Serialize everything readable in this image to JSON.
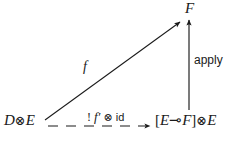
{
  "diagram": {
    "kind": "commutative-diagram",
    "background_color": "#ffffff",
    "ink_color": "#1a1a1a",
    "nodes": {
      "source": {
        "name": "source-object",
        "text": "D ⊗ E",
        "left_factor": "D",
        "tensor": "⊗",
        "right_factor": "E"
      },
      "target": {
        "name": "target-object",
        "text": "[E ⊸ F] ⊗ E",
        "open_bracket": "[",
        "hom_domain": "E",
        "lollipop": "⊸",
        "hom_codomain": "F",
        "close_bracket": "]",
        "tensor": "⊗",
        "right_factor": "E"
      },
      "apex": {
        "name": "apex-object",
        "text": "F"
      }
    },
    "edges": {
      "diagonal": {
        "name": "f-arrow",
        "label": "f",
        "style": "solid",
        "from": "source-object",
        "to": "apex-object"
      },
      "horizontal": {
        "name": "curry-arrow",
        "label": "! f′ ⊗ id",
        "label_parts": {
          "bang": "!",
          "fprime": "f′",
          "tensor": "⊗",
          "identity": "id"
        },
        "style": "dashed",
        "from": "source-object",
        "to": "target-object"
      },
      "vertical": {
        "name": "apply-arrow",
        "label": "apply",
        "style": "solid",
        "from": "target-object",
        "to": "apex-object"
      }
    }
  }
}
